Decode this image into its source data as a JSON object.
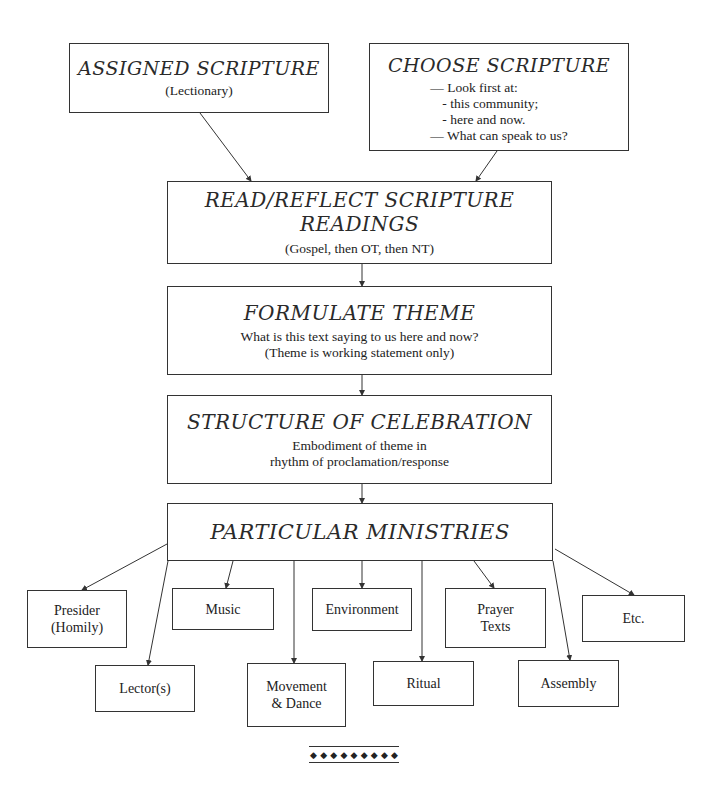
{
  "top_boxes": {
    "assigned": {
      "title": "ASSIGNED SCRIPTURE",
      "subtitle": "(Lectionary)"
    },
    "choose": {
      "title": "CHOOSE SCRIPTURE",
      "lines": [
        "— Look first at:",
        "- this community;",
        "- here and now.",
        "— What can speak to us?"
      ]
    }
  },
  "steps": [
    {
      "title": "READ/REFLECT SCRIPTURE READINGS",
      "lines": [
        "(Gospel, then OT, then NT)"
      ]
    },
    {
      "title": "FORMULATE THEME",
      "lines": [
        "What is this text saying to us here and now?",
        "(Theme is working statement only)"
      ]
    },
    {
      "title": "STRUCTURE OF CELEBRATION",
      "lines": [
        "Embodiment of theme in",
        "rhythm of proclamation/response"
      ]
    },
    {
      "title": "PARTICULAR MINISTRIES",
      "lines": []
    }
  ],
  "ministries": [
    {
      "id": "presider",
      "lines": [
        "Presider",
        "(Homily)"
      ]
    },
    {
      "id": "music",
      "lines": [
        "Music"
      ]
    },
    {
      "id": "environment",
      "lines": [
        "Environment"
      ]
    },
    {
      "id": "prayer-texts",
      "lines": [
        "Prayer",
        "Texts"
      ]
    },
    {
      "id": "etc",
      "lines": [
        "Etc."
      ]
    },
    {
      "id": "lectors",
      "lines": [
        "Lector(s)"
      ]
    },
    {
      "id": "movement-dance",
      "lines": [
        "Movement",
        "& Dance"
      ]
    },
    {
      "id": "ritual",
      "lines": [
        "Ritual"
      ]
    },
    {
      "id": "assembly",
      "lines": [
        "Assembly"
      ]
    }
  ],
  "ornament": {
    "glyph": "◆",
    "count": 9
  },
  "colors": {
    "line": "#333333",
    "text": "#222222",
    "background": "#ffffff"
  }
}
